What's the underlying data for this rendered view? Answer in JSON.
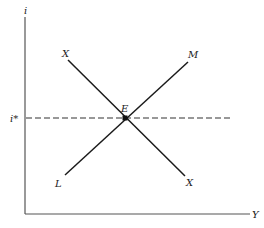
{
  "diagram": {
    "title": "",
    "axes": {
      "y_label": "i",
      "x_label": "Y"
    },
    "reference_line": {
      "label": "i*",
      "style": "dashed"
    },
    "curves": [
      {
        "name": "LM",
        "start_label": "L",
        "end_label": "M",
        "slope": "upward"
      },
      {
        "name": "XX",
        "start_label": "X",
        "end_label": "X",
        "slope": "downward"
      }
    ],
    "equilibrium": {
      "label": "E",
      "marker": "filled-square"
    }
  }
}
